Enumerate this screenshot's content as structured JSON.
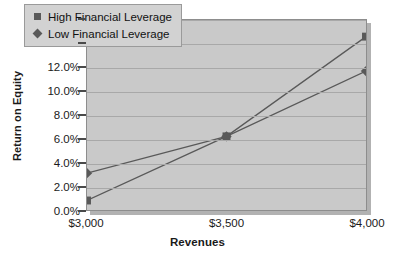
{
  "chart_data": {
    "type": "line",
    "title": "",
    "xlabel": "Revenues",
    "ylabel": "Return on Equity",
    "categories": [
      "$3,000",
      "$3,500",
      "$4,000"
    ],
    "series": [
      {
        "name": "High Financial Leverage",
        "marker": "square",
        "color": "#595959",
        "values": [
          0.8,
          6.2,
          14.6
        ]
      },
      {
        "name": "Low Financial Leverage",
        "marker": "diamond",
        "color": "#595959",
        "values": [
          3.1,
          6.2,
          11.7
        ]
      }
    ],
    "ylim": [
      0,
      16
    ],
    "ytick_step": 2,
    "ytick_labels": [
      "0.0%",
      "2.0%",
      "4.0%",
      "6.0%",
      "8.0%",
      "10.0%",
      "12.0%",
      "14.0%",
      "16.0%"
    ],
    "grid": true,
    "legend_position": "top-left-inside",
    "plot_background": "#c9c9c9",
    "gridline_color": "#a8a8a8",
    "axis_color": "#4a4a4a"
  },
  "legend": {
    "items": [
      {
        "label": "High Financial Leverage",
        "marker": "square"
      },
      {
        "label": "Low Financial Leverage",
        "marker": "diamond"
      }
    ]
  },
  "axes": {
    "y_title": "Return on Equity",
    "x_title": "Revenues"
  }
}
